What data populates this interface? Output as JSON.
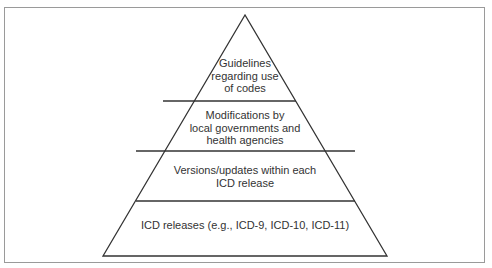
{
  "diagram": {
    "type": "pyramid",
    "levels_top_to_bottom": [
      {
        "label_lines": [
          "Guidelines",
          "regarding use",
          "of codes"
        ]
      },
      {
        "label_lines": [
          "Modifications by",
          "local governments and",
          "health agencies"
        ]
      },
      {
        "label_lines": [
          "Versions/updates within each",
          "ICD release"
        ]
      },
      {
        "label_lines": [
          "ICD releases (e.g., ICD-9, ICD-10, ICD-11)"
        ]
      }
    ],
    "colors": {
      "line": "#333333",
      "frame": "#9a9a9a",
      "text": "#333333"
    }
  }
}
